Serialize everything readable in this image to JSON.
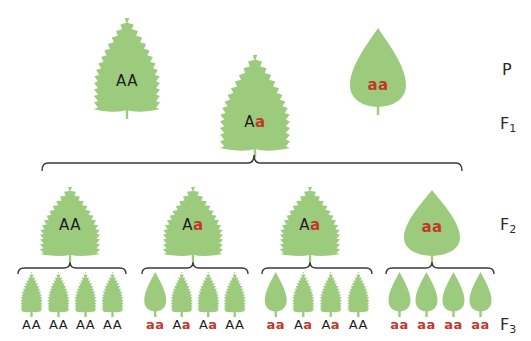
{
  "colors": {
    "leaf": "#9ccb7e",
    "dominant_text": "#1e1e1e",
    "recessive_text": "#c0392b",
    "brace": "#3a3a3a"
  },
  "generations": [
    {
      "label": "P",
      "sub": ""
    },
    {
      "label": "F",
      "sub": "1"
    },
    {
      "label": "F",
      "sub": "2"
    },
    {
      "label": "F",
      "sub": "3"
    }
  ],
  "P": [
    {
      "genotype": [
        "A",
        "A"
      ],
      "shape": "serrated"
    },
    {
      "genotype": [
        "a",
        "a"
      ],
      "shape": "smooth"
    }
  ],
  "F1": [
    {
      "genotype": [
        "A",
        "a"
      ],
      "shape": "serrated"
    }
  ],
  "F2": [
    {
      "genotype": [
        "A",
        "A"
      ],
      "shape": "serrated"
    },
    {
      "genotype": [
        "A",
        "a"
      ],
      "shape": "serrated"
    },
    {
      "genotype": [
        "A",
        "a"
      ],
      "shape": "serrated"
    },
    {
      "genotype": [
        "a",
        "a"
      ],
      "shape": "smooth"
    }
  ],
  "F3": [
    [
      {
        "genotype": [
          "A",
          "A"
        ],
        "shape": "serrated"
      },
      {
        "genotype": [
          "A",
          "A"
        ],
        "shape": "serrated"
      },
      {
        "genotype": [
          "A",
          "A"
        ],
        "shape": "serrated"
      },
      {
        "genotype": [
          "A",
          "A"
        ],
        "shape": "serrated"
      }
    ],
    [
      {
        "genotype": [
          "a",
          "a"
        ],
        "shape": "smooth"
      },
      {
        "genotype": [
          "A",
          "a"
        ],
        "shape": "serrated"
      },
      {
        "genotype": [
          "A",
          "a"
        ],
        "shape": "serrated"
      },
      {
        "genotype": [
          "A",
          "A"
        ],
        "shape": "serrated"
      }
    ],
    [
      {
        "genotype": [
          "a",
          "a"
        ],
        "shape": "smooth"
      },
      {
        "genotype": [
          "A",
          "a"
        ],
        "shape": "serrated"
      },
      {
        "genotype": [
          "A",
          "a"
        ],
        "shape": "serrated"
      },
      {
        "genotype": [
          "A",
          "A"
        ],
        "shape": "serrated"
      }
    ],
    [
      {
        "genotype": [
          "a",
          "a"
        ],
        "shape": "smooth"
      },
      {
        "genotype": [
          "a",
          "a"
        ],
        "shape": "smooth"
      },
      {
        "genotype": [
          "a",
          "a"
        ],
        "shape": "smooth"
      },
      {
        "genotype": [
          "a",
          "a"
        ],
        "shape": "smooth"
      }
    ]
  ]
}
